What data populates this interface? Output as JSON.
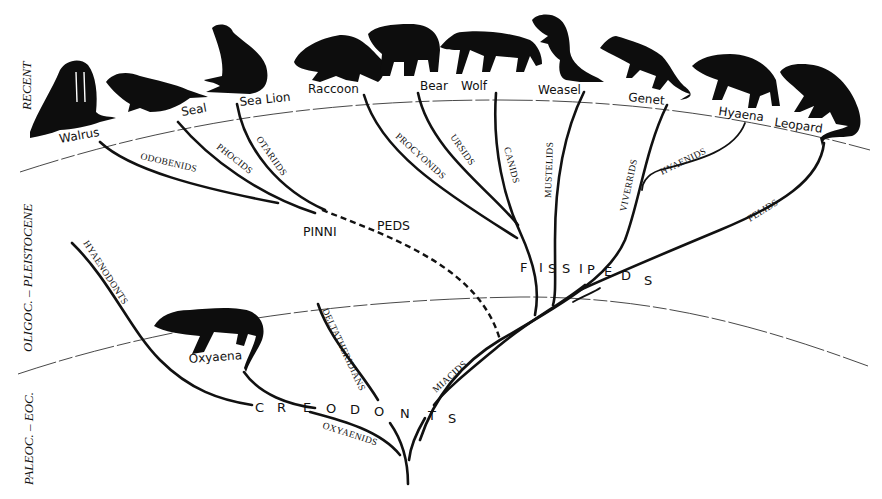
{
  "diagram": {
    "type": "phylogenetic-tree"
  },
  "eras": [
    {
      "label": "RECENT"
    },
    {
      "label": "OLIGOC. – PLEISTOCENE"
    },
    {
      "label": "PALEOC. – EOC."
    }
  ],
  "species": [
    {
      "name": "Walrus"
    },
    {
      "name": "Seal"
    },
    {
      "name": "Sea Lion"
    },
    {
      "name": "Raccoon"
    },
    {
      "name": "Bear"
    },
    {
      "name": "Wolf"
    },
    {
      "name": "Weasel"
    },
    {
      "name": "Genet"
    },
    {
      "name": "Hyaena"
    },
    {
      "name": "Leopard"
    },
    {
      "name": "Oxyaena"
    }
  ],
  "families": [
    {
      "name": "ODOBENIDS"
    },
    {
      "name": "PHOCIDS"
    },
    {
      "name": "OTARIIDS"
    },
    {
      "name": "PROCYONIDS"
    },
    {
      "name": "URSIDS"
    },
    {
      "name": "CANIDS"
    },
    {
      "name": "MUSTELIDS"
    },
    {
      "name": "VIVERRIDS"
    },
    {
      "name": "HYAENIDS"
    },
    {
      "name": "FELIDS"
    },
    {
      "name": "HYAENODONTS"
    },
    {
      "name": "DELTATHERIDIANS"
    },
    {
      "name": "OXYAENIDS"
    },
    {
      "name": "MIACIDS"
    }
  ],
  "groups": {
    "pinnipeds": {
      "part1": "PINNI",
      "part2": "PEDS"
    },
    "fissipeds": {
      "letters": [
        "F",
        "I",
        "S",
        "S",
        "I",
        "P",
        "E",
        "D",
        "S"
      ]
    },
    "creodonts": {
      "letters": [
        "C",
        "R",
        "E",
        "O",
        "D",
        "O",
        "N",
        "T",
        "S"
      ]
    }
  }
}
